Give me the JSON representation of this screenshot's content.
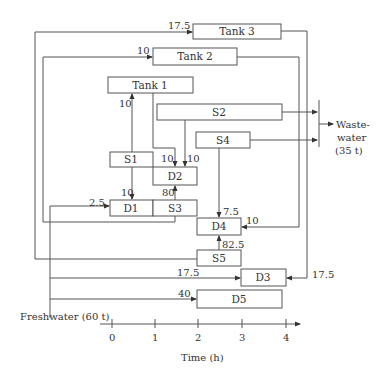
{
  "diagram": {
    "boxes": {
      "tank3": "Tank 3",
      "tank2": "Tank 2",
      "tank1": "Tank 1",
      "s2": "S2",
      "s4": "S4",
      "s1": "S1",
      "d2": "D2",
      "d1": "D1",
      "s3": "S3",
      "d4": "D4",
      "s5": "S5",
      "d3": "D3",
      "d5": "D5"
    },
    "flows": {
      "to_tank3": "17.5",
      "to_tank2": "10",
      "s1_to_tank1": "10",
      "tank1_to_d2": "10",
      "s2_to_d2": "10",
      "s1_to_d1": "10",
      "s3_to_d2": "80",
      "fresh_to_d1": "2.5",
      "s4_to_d4": "7.5",
      "tank2_to_d4": "10",
      "s5_to_d4": "82.5",
      "fresh_to_d3": "17.5",
      "tank3_to_d3": "17.5",
      "fresh_to_d5": "40"
    },
    "wastewater": [
      "Waste-",
      "water",
      "(35 t)"
    ],
    "freshwater": "Freshwater (60 t)",
    "axis": {
      "ticks": [
        "0",
        "1",
        "2",
        "3",
        "4"
      ],
      "label": "Time (h)"
    }
  }
}
